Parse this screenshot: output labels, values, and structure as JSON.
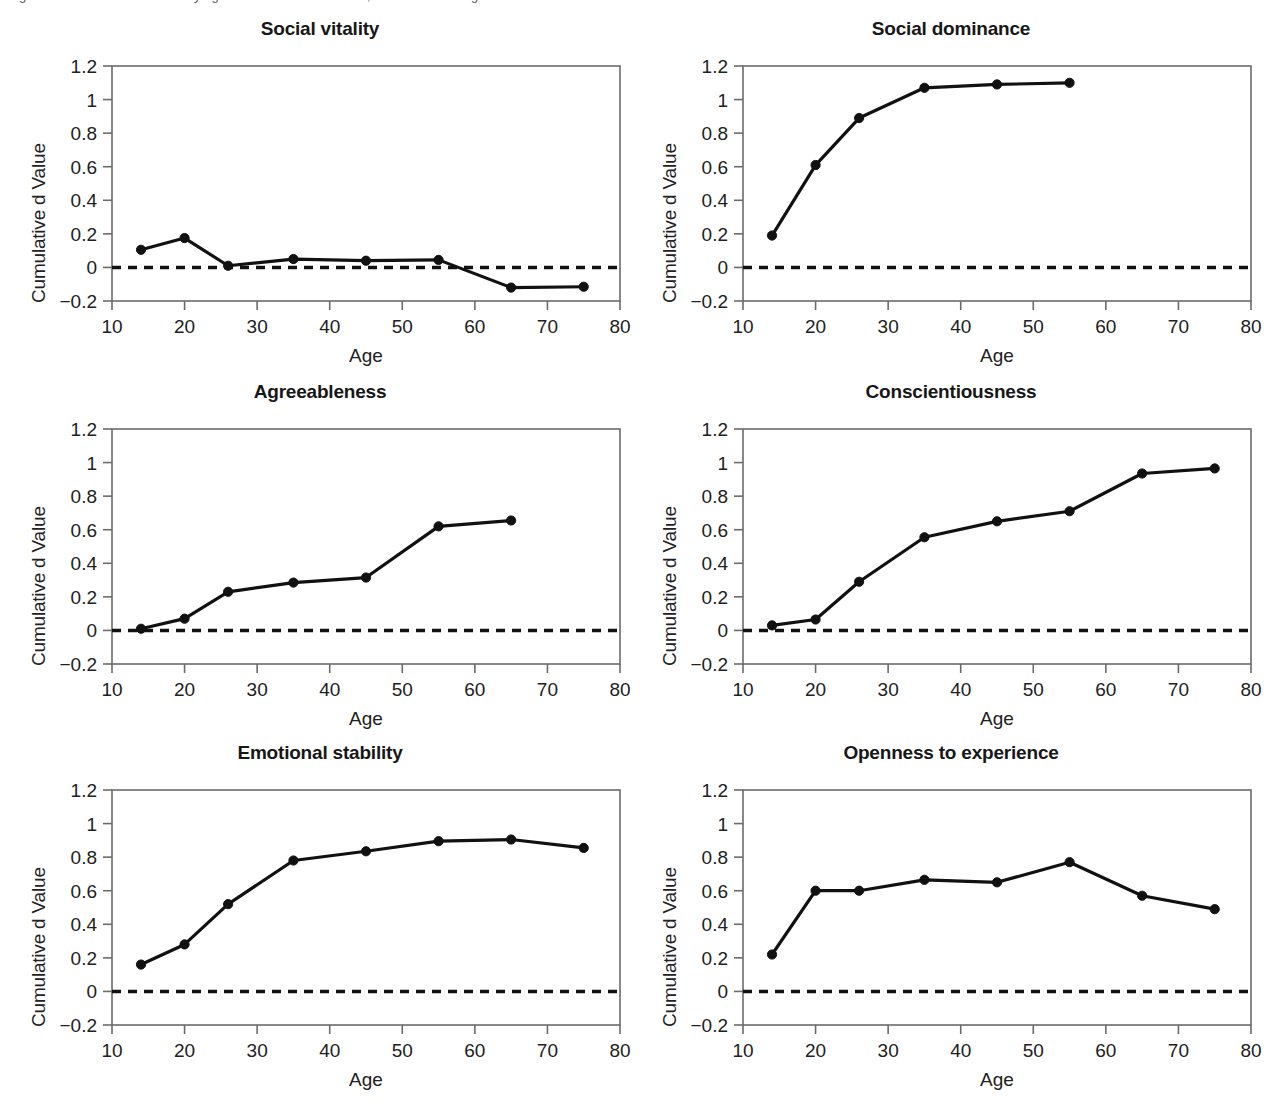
{
  "figure": {
    "cut_caption": "Figure 3. Cumulative d values by age for the six trait domains; mean-level change across the life course.",
    "axis_label_x": "Age",
    "axis_label_y": "Cumulative d Value",
    "colors": {
      "line": "#111111",
      "marker": "#111111",
      "axis": "#6b6b6b",
      "zero_line": "#111111",
      "background": "#ffffff",
      "text": "#1a1a1a"
    },
    "axis": {
      "xticks": [
        10,
        20,
        30,
        40,
        50,
        60,
        70,
        80
      ],
      "xtick_labels": [
        "10",
        "20",
        "30",
        "40",
        "50",
        "60",
        "70",
        "80"
      ],
      "yticks": [
        -0.2,
        0,
        0.2,
        0.4,
        0.6,
        0.8,
        1,
        1.2
      ],
      "ytick_labels": [
        "−0.2",
        "0",
        "0.2",
        "0.4",
        "0.6",
        "0.8",
        "1",
        "1.2"
      ],
      "xlim": [
        10,
        80
      ],
      "ylim": [
        -0.2,
        1.2
      ],
      "grid": false,
      "zero_reference_line": 0
    }
  },
  "chart_data": [
    {
      "type": "line",
      "title": "Social vitality",
      "xlabel": "Age",
      "ylabel": "Cumulative d Value",
      "xlim": [
        10,
        80
      ],
      "ylim": [
        -0.2,
        1.2
      ],
      "grid": false,
      "legend": "none",
      "x": [
        14,
        20,
        26,
        35,
        45,
        55,
        65,
        75
      ],
      "values": [
        0.105,
        0.175,
        0.01,
        0.05,
        0.04,
        0.045,
        -0.12,
        -0.115
      ]
    },
    {
      "type": "line",
      "title": "Social dominance",
      "xlabel": "Age",
      "ylabel": "Cumulative d Value",
      "xlim": [
        10,
        80
      ],
      "ylim": [
        -0.2,
        1.2
      ],
      "grid": false,
      "legend": "none",
      "x": [
        14,
        20,
        26,
        35,
        45,
        55
      ],
      "values": [
        0.19,
        0.61,
        0.89,
        1.07,
        1.09,
        1.1
      ]
    },
    {
      "type": "line",
      "title": "Agreeableness",
      "xlabel": "Age",
      "ylabel": "Cumulative d Value",
      "xlim": [
        10,
        80
      ],
      "ylim": [
        -0.2,
        1.2
      ],
      "grid": false,
      "legend": "none",
      "x": [
        14,
        20,
        26,
        35,
        45,
        55,
        65
      ],
      "values": [
        0.01,
        0.07,
        0.23,
        0.285,
        0.315,
        0.62,
        0.655
      ]
    },
    {
      "type": "line",
      "title": "Conscientiousness",
      "xlabel": "Age",
      "ylabel": "Cumulative d Value",
      "xlim": [
        10,
        80
      ],
      "ylim": [
        -0.2,
        1.2
      ],
      "grid": false,
      "legend": "none",
      "x": [
        14,
        20,
        26,
        35,
        45,
        55,
        65,
        75
      ],
      "values": [
        0.03,
        0.065,
        0.29,
        0.555,
        0.65,
        0.71,
        0.935,
        0.965
      ]
    },
    {
      "type": "line",
      "title": "Emotional stability",
      "xlabel": "Age",
      "ylabel": "Cumulative d Value",
      "xlim": [
        10,
        80
      ],
      "ylim": [
        -0.2,
        1.2
      ],
      "grid": false,
      "legend": "none",
      "x": [
        14,
        20,
        26,
        35,
        45,
        55,
        65,
        75
      ],
      "values": [
        0.16,
        0.28,
        0.52,
        0.78,
        0.835,
        0.895,
        0.905,
        0.855
      ]
    },
    {
      "type": "line",
      "title": "Openness to experience",
      "xlabel": "Age",
      "ylabel": "Cumulative d Value",
      "xlim": [
        10,
        80
      ],
      "ylim": [
        -0.2,
        1.2
      ],
      "grid": false,
      "legend": "none",
      "x": [
        14,
        20,
        26,
        35,
        45,
        55,
        65,
        75
      ],
      "values": [
        0.22,
        0.6,
        0.6,
        0.665,
        0.65,
        0.77,
        0.57,
        0.49
      ]
    }
  ]
}
